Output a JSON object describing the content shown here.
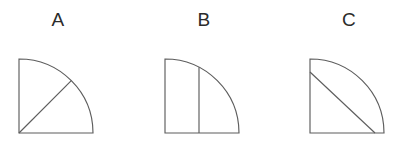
{
  "canvas": {
    "width": 407,
    "height": 151,
    "background_color": "#ffffff"
  },
  "style": {
    "stroke_color": "#5d5d5d",
    "stroke_width": 1.15,
    "label_color": "#2b2b2b",
    "fill": "none"
  },
  "figures": [
    {
      "label": "A",
      "shape": "quarter-circle",
      "description": "Quarter circle with center at bottom-left corner and a radius line drawn from the center to the arc at approximately 45 degrees, dividing the quarter into two equal sectors.",
      "origin_x": 11,
      "origin_y": 79,
      "radius": 74,
      "divider": {
        "type": "radius-line",
        "from": "center",
        "to": "arc",
        "angle_degrees": 45,
        "x1": 11,
        "y1": 79,
        "x2": 63.3,
        "y2": 26.7
      }
    },
    {
      "label": "B",
      "shape": "quarter-circle",
      "description": "Quarter circle with center at bottom-left corner and a vertical chord line from the arc down to the bottom edge at about 46 percent of the radius.",
      "origin_x": 11,
      "origin_y": 79,
      "radius": 74,
      "divider": {
        "type": "vertical-chord",
        "position_fraction": 0.46,
        "x1": 45.0,
        "y1": 79,
        "x2": 45.0,
        "y2": 13.3
      }
    },
    {
      "label": "C",
      "shape": "quarter-circle",
      "description": "Quarter circle with center at bottom-left corner and a diagonal chord from the left edge near the top down to the bottom edge near the right, cutting off a corner region.",
      "origin_x": 11,
      "origin_y": 79,
      "radius": 74,
      "divider": {
        "type": "diagonal-chord",
        "x1": 11,
        "y1": 18.0,
        "x2": 76.0,
        "y2": 79
      }
    }
  ]
}
